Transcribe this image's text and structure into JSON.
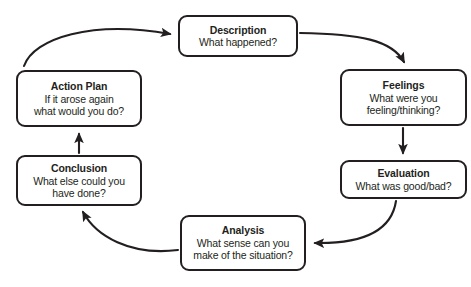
{
  "diagram": {
    "colors": {
      "stroke": "#231f20",
      "background": "#ffffff",
      "text": "#231f20"
    },
    "nodes": [
      {
        "id": "description",
        "title": "Description",
        "lines": [
          "What happened?"
        ]
      },
      {
        "id": "feelings",
        "title": "Feelings",
        "lines": [
          "What were you",
          "feeling/thinking?"
        ]
      },
      {
        "id": "evaluation",
        "title": "Evaluation",
        "lines": [
          "What was good/bad?"
        ]
      },
      {
        "id": "analysis",
        "title": "Analysis",
        "lines": [
          "What sense can you",
          "make of the situation?"
        ]
      },
      {
        "id": "conclusion",
        "title": "Conclusion",
        "lines": [
          "What else could you",
          "have done?"
        ]
      },
      {
        "id": "action_plan",
        "title": "Action Plan",
        "lines": [
          "If it arose again",
          "what would you do?"
        ]
      }
    ],
    "connectors": [
      {
        "from": "description",
        "to": "feelings",
        "style": "curved"
      },
      {
        "from": "feelings",
        "to": "evaluation",
        "style": "straight"
      },
      {
        "from": "evaluation",
        "to": "analysis",
        "style": "curved"
      },
      {
        "from": "analysis",
        "to": "conclusion",
        "style": "curved"
      },
      {
        "from": "conclusion",
        "to": "action_plan",
        "style": "straight"
      },
      {
        "from": "action_plan",
        "to": "description",
        "style": "curved"
      }
    ],
    "caption": ""
  }
}
